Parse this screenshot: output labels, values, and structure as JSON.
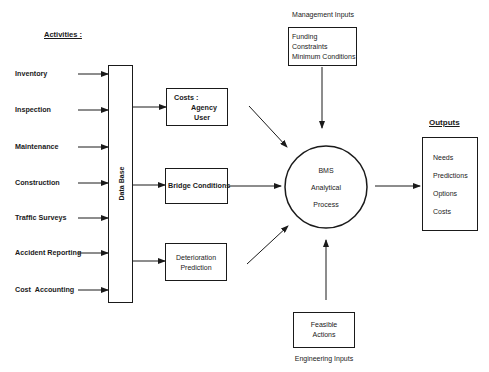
{
  "diagram": {
    "activities_heading": "Activities :",
    "activities": [
      "Inventory",
      "Inspection",
      "Maintenance",
      "Construction",
      "Traffic Surveys",
      "Accident Reporting",
      "Cost  Accounting"
    ],
    "database_label": "Data Base",
    "costs_box": {
      "title": "Costs :",
      "lines": [
        "Agency",
        "User"
      ]
    },
    "bridge_conditions_label": "Bridge Conditions",
    "deterioration_box": {
      "lines": [
        "Deterioration",
        "Prediction"
      ]
    },
    "management_heading": "Management Inputs",
    "management_box": {
      "lines": [
        "Funding",
        "Constraints",
        "Minimum Conditions"
      ]
    },
    "process_circle": {
      "lines": [
        "BMS",
        "Analytical",
        "Process"
      ]
    },
    "engineering_box": {
      "lines": [
        "Feasible",
        "Actions"
      ]
    },
    "engineering_heading": "Engineering Inputs",
    "outputs_heading": "Outputs",
    "outputs": [
      "Needs",
      "Predictions",
      "Options",
      "Costs"
    ]
  }
}
